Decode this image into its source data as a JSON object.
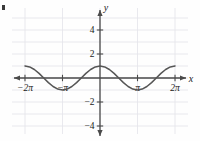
{
  "figure": {
    "corner_mark": "c",
    "axis_labels": {
      "x": "x",
      "y": "y"
    },
    "x_tick_labels": [
      "−2π",
      "−π",
      "π",
      "2π"
    ],
    "y_tick_labels": [
      "4",
      "2",
      "−2",
      "−4"
    ],
    "colors": {
      "axis": "#4a4a4a",
      "grid": "#e3e3ea",
      "curve": "#555555",
      "text": "#1a1a1a",
      "background": "#fefefe"
    }
  },
  "chart_data": {
    "type": "line",
    "title": "",
    "xlabel": "x",
    "ylabel": "y",
    "xlim": [
      -7.6,
      7.6
    ],
    "ylim": [
      -5.0,
      5.0
    ],
    "grid": true,
    "legend": null,
    "x_ticks": [
      -6.283185,
      -3.141593,
      3.141593,
      6.283185
    ],
    "x_tick_labels": [
      "−2π",
      "−π",
      "π",
      "2π"
    ],
    "y_ticks": [
      4,
      2,
      -2,
      -4
    ],
    "y_tick_labels": [
      "4",
      "2",
      "−2",
      "−4"
    ],
    "function": "y = cos(x)",
    "amplitude": 1,
    "period": 6.283185,
    "series": [
      {
        "name": "y = cos(x)",
        "x": [
          -6.283185,
          -5.890486,
          -5.497787,
          -5.105088,
          -4.712389,
          -4.31969,
          -3.926991,
          -3.534292,
          -3.141593,
          -2.748894,
          -2.356194,
          -1.963495,
          -1.570796,
          -1.178097,
          -0.785398,
          -0.392699,
          0.0,
          0.392699,
          0.785398,
          1.178097,
          1.570796,
          1.963495,
          2.356194,
          2.748894,
          3.141593,
          3.534292,
          3.926991,
          4.31969,
          4.712389,
          5.105088,
          5.497787,
          5.890486,
          6.283185
        ],
        "y": [
          1.0,
          0.9239,
          0.7071,
          0.3827,
          0.0,
          -0.3827,
          -0.7071,
          -0.9239,
          -1.0,
          -0.9239,
          -0.7071,
          -0.3827,
          0.0,
          0.3827,
          0.7071,
          0.9239,
          1.0,
          0.9239,
          0.7071,
          0.3827,
          0.0,
          -0.3827,
          -0.7071,
          -0.9239,
          -1.0,
          -0.9239,
          -0.7071,
          -0.3827,
          0.0,
          0.3827,
          0.7071,
          0.9239,
          1.0
        ]
      }
    ]
  }
}
